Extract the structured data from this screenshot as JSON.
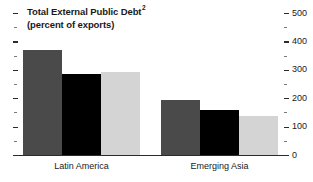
{
  "chart_data": {
    "type": "bar",
    "title": "Total External Public Debt",
    "title_superscript": "2",
    "subtitle": "(percent of exports)",
    "xlabel": "",
    "ylabel": "",
    "ylim": [
      0,
      500
    ],
    "y_axis_position": "right",
    "grid": false,
    "legend": "none",
    "major_tick_step": 100,
    "minor_tick_step": 50,
    "categories": [
      "Latin America",
      "Emerging Asia"
    ],
    "series": [
      {
        "name": "series-1",
        "color": "#4a4a4a",
        "values": [
          370,
          194
        ]
      },
      {
        "name": "series-2",
        "color": "#000000",
        "values": [
          285,
          158
        ]
      },
      {
        "name": "series-3",
        "color": "#d4d4d4",
        "values": [
          292,
          137
        ]
      }
    ],
    "y_tick_labels": [
      "500",
      "400",
      "300",
      "200",
      "100",
      "0"
    ],
    "y_tick_values": [
      500,
      400,
      300,
      200,
      100,
      0
    ],
    "y_minor_tick_values": [
      450,
      350,
      250,
      150,
      50
    ]
  },
  "colors": {
    "series_1": "#4a4a4a",
    "series_2": "#000000",
    "series_3": "#d4d4d4",
    "axis": "#2b2b2b",
    "text": "#1a1a1a",
    "background": "#ffffff"
  }
}
